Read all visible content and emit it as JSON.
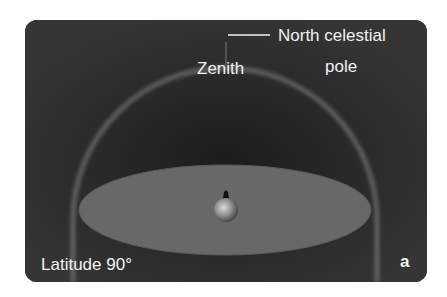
{
  "figure": {
    "labels": {
      "north_celestial_pole_line1": "North celestial",
      "north_celestial_pole_line2": "pole",
      "zenith": "Zenith",
      "latitude": "Latitude 90°",
      "panel_letter": "a"
    },
    "colors": {
      "background": "#2e2e2e",
      "dome_glow": "#8a8a8a",
      "horizon_plane": "#6a6a6a",
      "text": "#f2f2f2"
    }
  }
}
